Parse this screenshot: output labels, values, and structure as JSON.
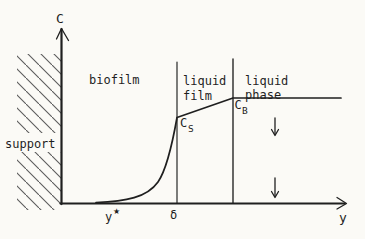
{
  "figure": {
    "type": "diagram",
    "colors": {
      "background": "#fbfaf6",
      "ink": "#1f1f1f",
      "hatch": "#5a5a5a"
    },
    "axis": {
      "y_label": "C",
      "x_label": "y"
    },
    "regions": {
      "support": "support",
      "biofilm": "biofilm",
      "liquid_film": [
        "liquid",
        "film"
      ],
      "liquid_phase": [
        "liquid",
        "phase"
      ]
    },
    "annotations": {
      "cs": {
        "main": "C",
        "sub": "S"
      },
      "cb": {
        "main": "C",
        "sub": "B"
      },
      "ystar": {
        "main": "y",
        "sup": "★"
      },
      "delta": "δ"
    }
  }
}
